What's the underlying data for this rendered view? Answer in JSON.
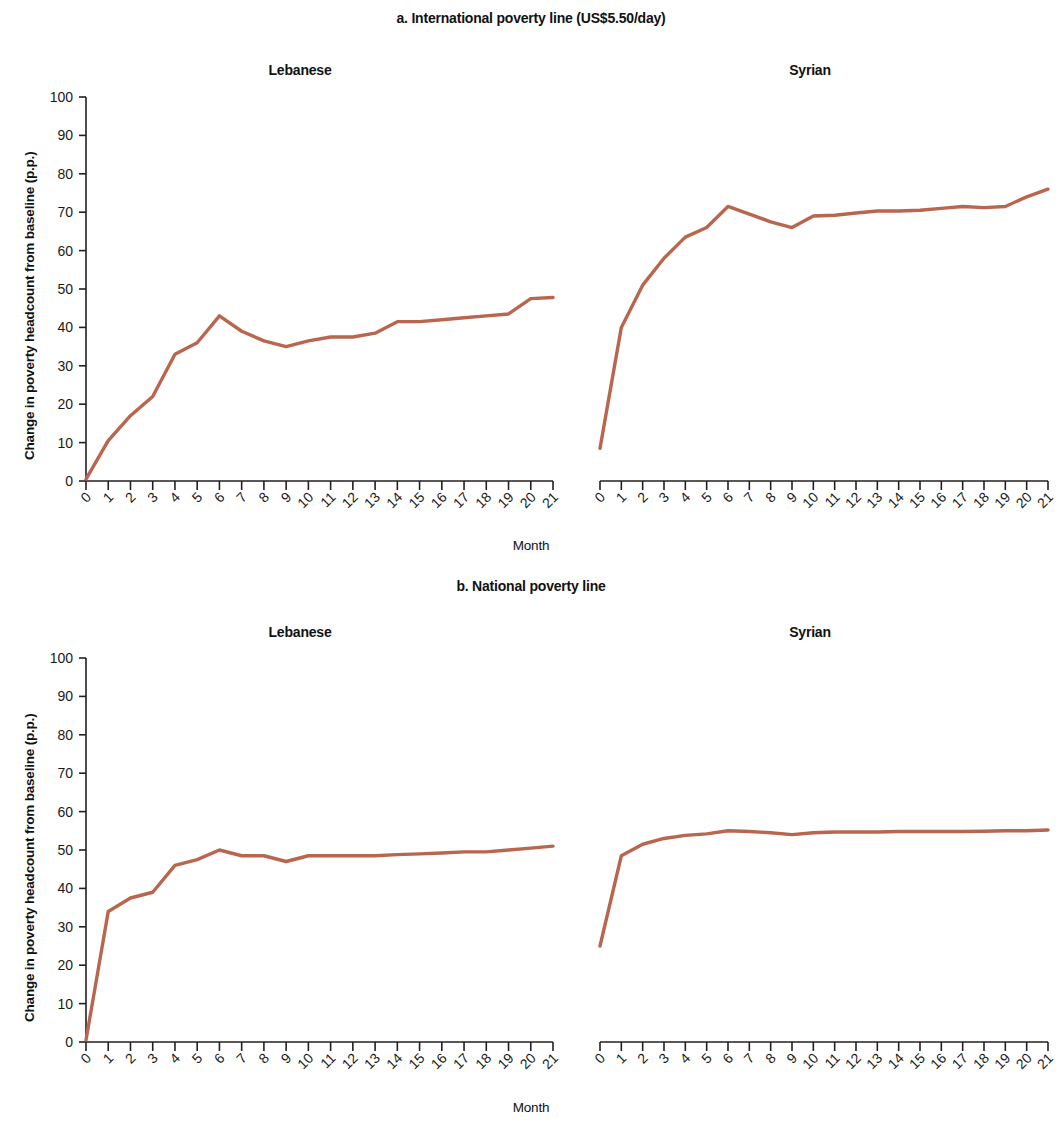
{
  "figure": {
    "panels": [
      {
        "id": "a",
        "title": "a. International poverty line (US$5.50/day)",
        "xlabel": "Month",
        "ylabel": "Change in poverty headcount from baseline (p.p.)",
        "subplots": [
          {
            "id": "a-lebanese",
            "title": "Lebanese"
          },
          {
            "id": "a-syrian",
            "title": "Syrian"
          }
        ]
      },
      {
        "id": "b",
        "title": "b. National poverty line",
        "xlabel": "Month",
        "ylabel": "Change in  poverty headcount from baseline (p.p.)",
        "subplots": [
          {
            "id": "b-lebanese",
            "title": "Lebanese"
          },
          {
            "id": "b-syrian",
            "title": "Syrian"
          }
        ]
      }
    ]
  },
  "style": {
    "line_color": "#b9664f",
    "axis_color": "#231f20"
  },
  "chart_data": [
    {
      "type": "line",
      "id": "a-lebanese",
      "title": "Lebanese",
      "panel_title": "a. International poverty line (US$5.50/day)",
      "xlabel": "Month",
      "ylabel": "Change in poverty headcount from baseline (p.p.)",
      "xlim": [
        0,
        21
      ],
      "ylim": [
        0,
        100
      ],
      "ytick_labels": [
        "0",
        "10",
        "20",
        "30",
        "40",
        "50",
        "60",
        "70",
        "80",
        "90",
        "100"
      ],
      "yticks": [
        0,
        10,
        20,
        30,
        40,
        50,
        60,
        70,
        80,
        90,
        100
      ],
      "xticks": [
        0,
        1,
        2,
        3,
        4,
        5,
        6,
        7,
        8,
        9,
        10,
        11,
        12,
        13,
        14,
        15,
        16,
        17,
        18,
        19,
        20,
        21
      ],
      "xtick_labels": [
        "0",
        "1",
        "2",
        "3",
        "4",
        "5",
        "6",
        "7",
        "8",
        "9",
        "10",
        "11",
        "12",
        "13",
        "14",
        "15",
        "16",
        "17",
        "18",
        "19",
        "20",
        "21"
      ],
      "grid": false,
      "legend": null,
      "x": [
        0,
        1,
        2,
        3,
        4,
        5,
        6,
        7,
        8,
        9,
        10,
        11,
        12,
        13,
        14,
        15,
        16,
        17,
        18,
        19,
        20,
        21
      ],
      "values": [
        0.5,
        10.5,
        17.0,
        22.0,
        33.0,
        36.0,
        43.0,
        39.0,
        36.5,
        35.0,
        36.5,
        37.5,
        37.5,
        38.5,
        41.5,
        41.5,
        42.0,
        42.5,
        43.0,
        43.5,
        47.5,
        47.8
      ]
    },
    {
      "type": "line",
      "id": "a-syrian",
      "title": "Syrian",
      "panel_title": "a. International poverty line (US$5.50/day)",
      "xlabel": "Month",
      "ylabel": "Change in poverty headcount from baseline (p.p.)",
      "xlim": [
        0,
        21
      ],
      "ylim": [
        0,
        100
      ],
      "yticks": [
        0,
        10,
        20,
        30,
        40,
        50,
        60,
        70,
        80,
        90,
        100
      ],
      "xticks": [
        0,
        1,
        2,
        3,
        4,
        5,
        6,
        7,
        8,
        9,
        10,
        11,
        12,
        13,
        14,
        15,
        16,
        17,
        18,
        19,
        20,
        21
      ],
      "xtick_labels": [
        "0",
        "1",
        "2",
        "3",
        "4",
        "5",
        "6",
        "7",
        "8",
        "9",
        "10",
        "11",
        "12",
        "13",
        "14",
        "15",
        "16",
        "17",
        "18",
        "19",
        "20",
        "21"
      ],
      "grid": false,
      "legend": null,
      "x": [
        0,
        1,
        2,
        3,
        4,
        5,
        6,
        7,
        8,
        9,
        10,
        11,
        12,
        13,
        14,
        15,
        16,
        17,
        18,
        19,
        20,
        21
      ],
      "values": [
        8.5,
        40.0,
        51.0,
        58.0,
        63.5,
        66.0,
        71.5,
        69.5,
        67.5,
        66.0,
        69.0,
        69.2,
        69.8,
        70.3,
        70.3,
        70.5,
        71.0,
        71.5,
        71.2,
        71.5,
        74.0,
        76.0
      ]
    },
    {
      "type": "line",
      "id": "b-lebanese",
      "title": "Lebanese",
      "panel_title": "b. National poverty line",
      "xlabel": "Month",
      "ylabel": "Change in  poverty headcount from baseline (p.p.)",
      "xlim": [
        0,
        21
      ],
      "ylim": [
        0,
        100
      ],
      "yticks": [
        0,
        10,
        20,
        30,
        40,
        50,
        60,
        70,
        80,
        90,
        100
      ],
      "xticks": [
        0,
        1,
        2,
        3,
        4,
        5,
        6,
        7,
        8,
        9,
        10,
        11,
        12,
        13,
        14,
        15,
        16,
        17,
        18,
        19,
        20,
        21
      ],
      "xtick_labels": [
        "0",
        "1",
        "2",
        "3",
        "4",
        "5",
        "6",
        "7",
        "8",
        "9",
        "10",
        "11",
        "12",
        "13",
        "14",
        "15",
        "16",
        "17",
        "18",
        "19",
        "20",
        "21"
      ],
      "grid": false,
      "legend": null,
      "x": [
        0,
        1,
        2,
        3,
        4,
        5,
        6,
        7,
        8,
        9,
        10,
        11,
        12,
        13,
        14,
        15,
        16,
        17,
        18,
        19,
        20,
        21
      ],
      "values": [
        0.5,
        34.0,
        37.5,
        39.0,
        46.0,
        47.5,
        50.0,
        48.5,
        48.5,
        47.0,
        48.5,
        48.5,
        48.5,
        48.5,
        48.8,
        49.0,
        49.2,
        49.5,
        49.5,
        50.0,
        50.5,
        51.0
      ]
    },
    {
      "type": "line",
      "id": "b-syrian",
      "title": "Syrian",
      "panel_title": "b. National poverty line",
      "xlabel": "Month",
      "ylabel": "Change in  poverty headcount from baseline (p.p.)",
      "xlim": [
        0,
        21
      ],
      "ylim": [
        0,
        100
      ],
      "yticks": [
        0,
        10,
        20,
        30,
        40,
        50,
        60,
        70,
        80,
        90,
        100
      ],
      "xticks": [
        0,
        1,
        2,
        3,
        4,
        5,
        6,
        7,
        8,
        9,
        10,
        11,
        12,
        13,
        14,
        15,
        16,
        17,
        18,
        19,
        20,
        21
      ],
      "xtick_labels": [
        "0",
        "1",
        "2",
        "3",
        "4",
        "5",
        "6",
        "7",
        "8",
        "9",
        "10",
        "11",
        "12",
        "13",
        "14",
        "15",
        "16",
        "17",
        "18",
        "19",
        "20",
        "21"
      ],
      "grid": false,
      "legend": null,
      "x": [
        0,
        1,
        2,
        3,
        4,
        5,
        6,
        7,
        8,
        9,
        10,
        11,
        12,
        13,
        14,
        15,
        16,
        17,
        18,
        19,
        20,
        21
      ],
      "values": [
        25.0,
        48.5,
        51.5,
        53.0,
        53.8,
        54.2,
        55.0,
        54.8,
        54.5,
        54.0,
        54.5,
        54.7,
        54.7,
        54.7,
        54.8,
        54.8,
        54.8,
        54.8,
        54.9,
        55.0,
        55.0,
        55.2
      ]
    }
  ]
}
